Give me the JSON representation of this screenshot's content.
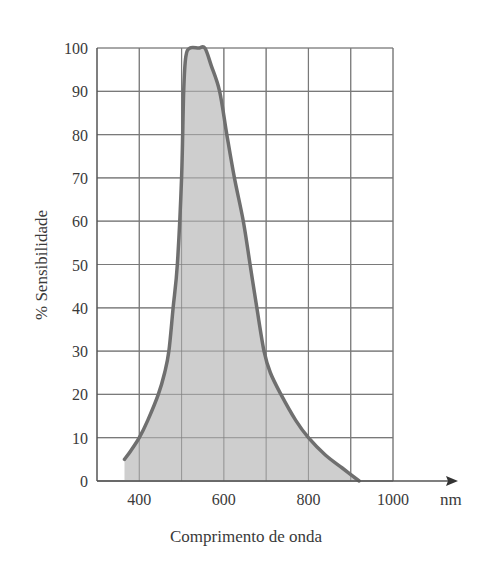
{
  "chart_data": {
    "type": "area",
    "title": "",
    "xlabel": "Comprimento de onda",
    "ylabel": "% Sensibilidade",
    "x_unit": "nm",
    "xlim": [
      300,
      1000
    ],
    "ylim": [
      0,
      100
    ],
    "grid": true,
    "legend": "none",
    "x_ticks": [
      400,
      600,
      800,
      1000
    ],
    "x_gridlines": [
      400,
      500,
      600,
      700,
      800,
      900,
      1000
    ],
    "y_ticks": [
      0,
      10,
      20,
      30,
      40,
      50,
      60,
      70,
      80,
      90,
      100
    ],
    "series": [
      {
        "name": "% Sensibilidade",
        "x": [
          365,
          380,
          400,
          420,
          445,
          460,
          470,
          480,
          490,
          500,
          505,
          510,
          520,
          540,
          555,
          570,
          590,
          607,
          625,
          646,
          662,
          678,
          695,
          710,
          735,
          770,
          800,
          840,
          880,
          920
        ],
        "y": [
          5,
          7,
          10,
          14,
          20,
          25,
          30,
          40,
          50,
          70,
          90,
          98,
          100,
          100,
          100,
          96,
          90,
          80,
          70,
          60,
          50,
          40,
          30,
          25,
          20,
          14,
          10,
          6,
          3,
          0
        ]
      }
    ],
    "colors": {
      "fill": "#c9c9c9",
      "line": "#6f6f6f",
      "grid": "#7a7a7a"
    }
  }
}
